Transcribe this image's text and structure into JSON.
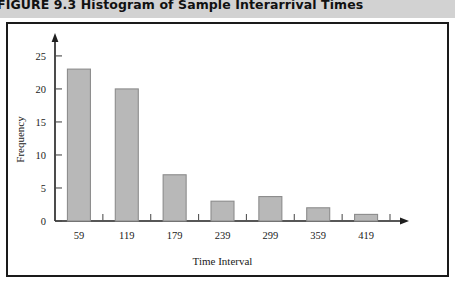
{
  "caption": {
    "text": "FIGURE 9.3  Histogram of Sample Interarrival Times"
  },
  "chart_data": {
    "type": "bar",
    "title": "Histogram of Sample Interarrival Times",
    "categories": [
      "59",
      "119",
      "179",
      "239",
      "299",
      "359",
      "419"
    ],
    "values": [
      23,
      20,
      7,
      3,
      3.7,
      2,
      1
    ],
    "xlabel": "Time Interval",
    "ylabel": "Frequency",
    "ylim": [
      0,
      26.5
    ],
    "yticks": [
      "0",
      "5",
      "10",
      "15",
      "20",
      "25"
    ],
    "ytick_values": [
      0,
      5,
      10,
      15,
      20,
      25
    ],
    "grid": false,
    "legend": false,
    "bar_color": "#b8b8b8",
    "bar_edge_color": "#8c8c8c",
    "axis_color": "#1f1f1f"
  }
}
